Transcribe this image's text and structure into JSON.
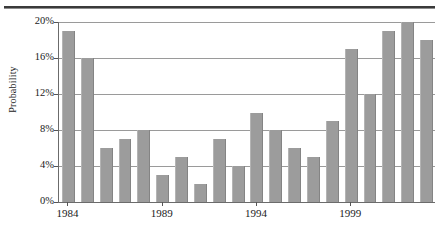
{
  "figure": {
    "top_rule": "horizontal-rule"
  },
  "axes": {
    "ylabel": "Probability",
    "ytick_labels": [
      "0%",
      "4%",
      "8%",
      "12%",
      "16%",
      "20%"
    ],
    "xtick_labels": [
      "1984",
      "1989",
      "1994",
      "1999"
    ]
  },
  "chart_data": {
    "type": "bar",
    "title": "",
    "subtitle": "",
    "xlabel": "",
    "ylabel": "Probability",
    "ylim": [
      0,
      20
    ],
    "ytick_values": [
      0,
      4,
      8,
      12,
      16,
      20
    ],
    "ytick_labels": [
      "0%",
      "4%",
      "8%",
      "12%",
      "16%",
      "20%"
    ],
    "xtick_labels": [
      "1984",
      "1989",
      "1994",
      "1999"
    ],
    "xtick_categories": [
      "1984",
      "1989",
      "1994",
      "1999"
    ],
    "grid": true,
    "grid_axis": "y",
    "legend": false,
    "legend_position": "none",
    "bar_color": "#9c9c9c",
    "value_unit": "percent",
    "categories": [
      "1984",
      "1985",
      "1986",
      "1987",
      "1988",
      "1989",
      "1990",
      "1991",
      "1992",
      "1993",
      "1994",
      "1995",
      "1996",
      "1997",
      "1998",
      "1999",
      "2000",
      "2001",
      "2002",
      "2003"
    ],
    "values": [
      19,
      16,
      6,
      7,
      8,
      3,
      5,
      2,
      7,
      4,
      9.9,
      8,
      6,
      5,
      9,
      17,
      12,
      19,
      20,
      18
    ],
    "series": [
      {
        "name": "Probability",
        "values": [
          19,
          16,
          6,
          7,
          8,
          3,
          5,
          2,
          7,
          4,
          9.9,
          8,
          6,
          5,
          9,
          17,
          12,
          19,
          20,
          18
        ]
      }
    ]
  }
}
